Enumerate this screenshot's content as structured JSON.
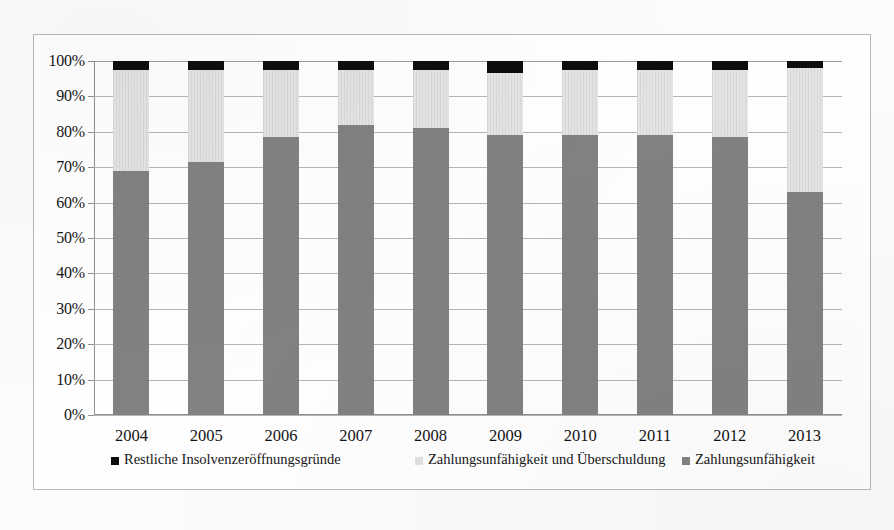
{
  "chart_data": {
    "type": "bar",
    "subtype": "stacked-100-percent",
    "title": "",
    "xlabel": "",
    "ylabel": "",
    "ylim": [
      0,
      100
    ],
    "ytick_labels": [
      "100%",
      "90%",
      "80%",
      "70%",
      "60%",
      "50%",
      "40%",
      "30%",
      "20%",
      "10%",
      "0%"
    ],
    "ytick_values": [
      100,
      90,
      80,
      70,
      60,
      50,
      40,
      30,
      20,
      10,
      0
    ],
    "grid": true,
    "legend_position": "bottom",
    "categories": [
      "2004",
      "2005",
      "2006",
      "2007",
      "2008",
      "2009",
      "2010",
      "2011",
      "2012",
      "2013"
    ],
    "series": [
      {
        "name": "Zahlungsunfähigkeit",
        "color": "#818181",
        "values": [
          69,
          71.5,
          78.5,
          82,
          81,
          79,
          79,
          79,
          78.5,
          63
        ]
      },
      {
        "name": "Zahlungsunfähigkeit und Überschuldung",
        "color": "#e4e4e4",
        "values": [
          28.5,
          26,
          19,
          15.5,
          16.5,
          17.5,
          18.5,
          18.5,
          19,
          35
        ]
      },
      {
        "name": "Restliche Insolvenzeröffnungsgründe",
        "color": "#0d0d0d",
        "values": [
          2.5,
          2.5,
          2.5,
          2.5,
          2.5,
          3.5,
          2.5,
          2.5,
          2.5,
          2
        ]
      }
    ]
  },
  "legend": {
    "items": [
      {
        "label": "Restliche Insolvenzeröffnungsgründe",
        "swatch": "sw-black"
      },
      {
        "label": "Zahlungsunfähigkeit und Überschuldung",
        "swatch": "sw-light"
      },
      {
        "label": "Zahlungsunfähigkeit",
        "swatch": "sw-gray"
      }
    ]
  }
}
